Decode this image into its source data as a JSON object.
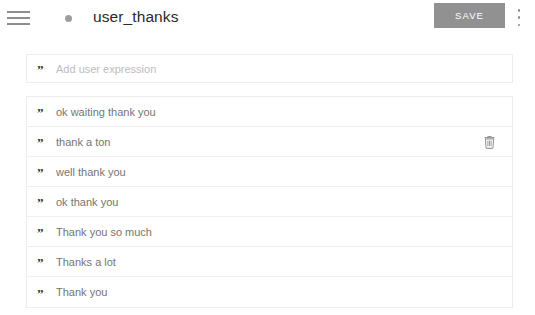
{
  "header": {
    "menu_icon": "hamburger-menu-icon",
    "status_dot": "status-dot-indicator",
    "title": "user_thanks",
    "save_label": "SAVE",
    "overflow_icon": "more-vertical-icon",
    "save_button_color": "#919191",
    "title_color": "#2b2b2b"
  },
  "input": {
    "quote_icon": "”",
    "placeholder": "Add user expression",
    "value": ""
  },
  "list": {
    "quote_icon": "”",
    "delete_icon": "trash-icon",
    "items": [
      {
        "text": "ok waiting thank you",
        "hovered": false
      },
      {
        "text": "thank a ton",
        "hovered": true
      },
      {
        "text": "well thank you",
        "hovered": false
      },
      {
        "text": "ok thank you",
        "hovered": false
      },
      {
        "text": "Thank you so much",
        "hovered": false
      },
      {
        "text": "Thanks a lot",
        "hovered": false
      },
      {
        "text": "Thank you",
        "hovered": false
      }
    ]
  }
}
